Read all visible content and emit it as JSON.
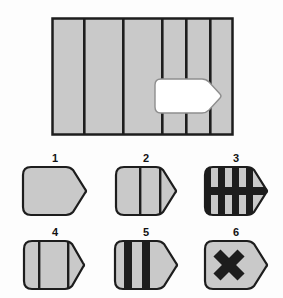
{
  "puzzle": {
    "type": "visual-reasoning-matrix",
    "colors": {
      "fill_gray": "#c9c9c9",
      "stroke_dark": "#1d1d1d",
      "cutout_white": "#ffffff",
      "background": "#fdfdfd",
      "label_text": "#121212"
    },
    "panel": {
      "name": "striped-panel",
      "fill": "#c9c9c9",
      "border": "#1d1d1d",
      "stripe_count": 5,
      "stripe_positions_pct": [
        18,
        39,
        60,
        73,
        86
      ],
      "cutout": {
        "name": "pentagon-cutout",
        "fill": "#ffffff",
        "shape": "pentagon-right-point"
      }
    },
    "options": [
      {
        "number": "1",
        "name": "option-1",
        "fill": "#c9c9c9",
        "marks": "none",
        "description": "plain gray pentagon"
      },
      {
        "number": "2",
        "name": "option-2",
        "fill": "#c9c9c9",
        "marks": "one-thin-vertical-line",
        "description": "pentagon with single vertical line and split tip"
      },
      {
        "number": "3",
        "name": "option-3",
        "fill": "#c9c9c9",
        "marks": "four-thick-vertical-bars-plus-horizontal-band",
        "description": "pentagon with vertical black stripes crossed by horizontal band"
      },
      {
        "number": "4",
        "name": "option-4",
        "fill": "#c9c9c9",
        "marks": "one-thin-vertical-line-left",
        "description": "pentagon with single line on left and split tip"
      },
      {
        "number": "5",
        "name": "option-5",
        "fill": "#c9c9c9",
        "marks": "two-thick-vertical-bars",
        "description": "pentagon with two thick black bars"
      },
      {
        "number": "6",
        "name": "option-6",
        "fill": "#c9c9c9",
        "marks": "thick-black-x",
        "description": "pentagon with bold X mark"
      }
    ]
  }
}
